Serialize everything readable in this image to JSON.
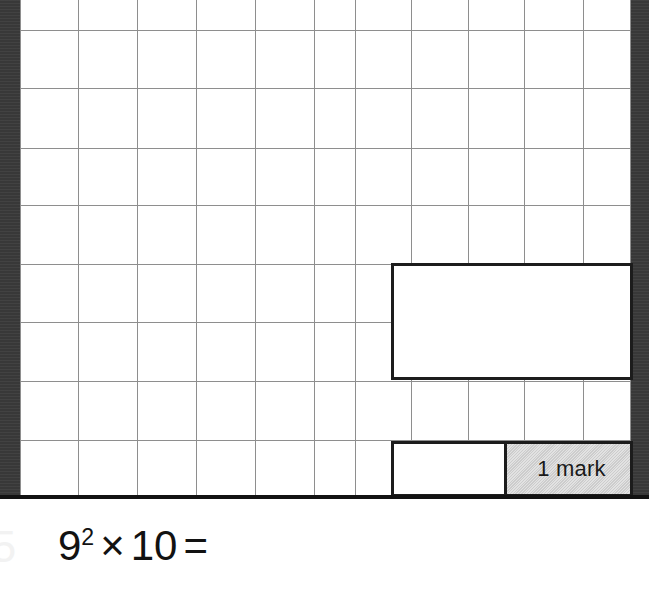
{
  "page": {
    "width": 649,
    "height": 590,
    "background_color": "#ffffff",
    "scan_edge_color": "#3b3b3b"
  },
  "answer_grid": {
    "name": "squared-answer-grid",
    "line_color": "#8e8e8e",
    "left": 20,
    "top": 0,
    "width": 610,
    "height": 497,
    "vertical_line_x": [
      0,
      58,
      117,
      176,
      235,
      294,
      335,
      391,
      448,
      504,
      563,
      610
    ],
    "horizontal_line_y": [
      30,
      88,
      148,
      205,
      264,
      322,
      381,
      440,
      497
    ]
  },
  "answer_boxes": [
    {
      "name": "answer-box-main",
      "value": "",
      "placeholder": "",
      "border_color": "#1c1c1c",
      "x": 391,
      "y": 263,
      "width": 242,
      "height": 117
    },
    {
      "name": "answer-box-lower",
      "value": "",
      "placeholder": "",
      "border_color": "#1c1c1c",
      "x": 391,
      "y": 441,
      "width": 242,
      "height": 56
    }
  ],
  "mark_badge": {
    "label": "1 mark",
    "background_color": "#d3d3d3",
    "text_color": "#1a1a1a",
    "border_color": "#1c1c1c"
  },
  "section_rule": {
    "color": "#121212",
    "thickness": 4
  },
  "question": {
    "number": "5",
    "expression_base": "9",
    "expression_exponent": "2",
    "expression_operator": "×",
    "expression_operand": "10",
    "expression_equals": "=",
    "expression_full": "9² × 10 =",
    "answer_value": ""
  }
}
